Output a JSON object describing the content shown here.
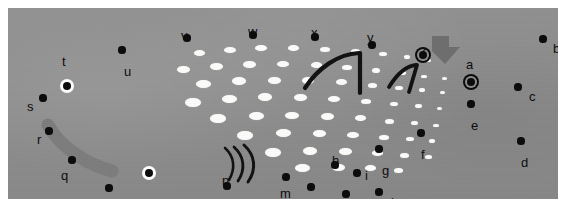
{
  "figure": {
    "kind": "annotated-grayscale-photo-panel",
    "background_color": "#8e8e8e",
    "margin_color": "#ffffff",
    "dot_color": "#fdfdfb",
    "marker_color": "#0a0a0a",
    "accent_arc_color": "#7b7b7b",
    "arrow_color": "#6e6e6e",
    "panel": {
      "x": 8,
      "y": 8,
      "width": 550,
      "height": 191
    }
  },
  "labels": [
    {
      "id": "a",
      "text": "a",
      "lx": 458,
      "ly": 50,
      "px": 463,
      "py": 74,
      "style": "ring"
    },
    {
      "id": "b",
      "text": "b",
      "lx": 545,
      "ly": 34,
      "px": 535,
      "py": 31,
      "style": "plain"
    },
    {
      "id": "c",
      "text": "c",
      "lx": 521,
      "ly": 82,
      "px": 510,
      "py": 79,
      "style": "plain"
    },
    {
      "id": "d",
      "text": "d",
      "lx": 513,
      "ly": 148,
      "px": 513,
      "py": 133,
      "style": "plain"
    },
    {
      "id": "e",
      "text": "e",
      "lx": 463,
      "ly": 111,
      "px": 463,
      "py": 96,
      "style": "plain"
    },
    {
      "id": "f",
      "text": "f",
      "lx": 413,
      "ly": 140,
      "px": 413,
      "py": 125,
      "style": "plain"
    },
    {
      "id": "g",
      "text": "g",
      "lx": 374,
      "ly": 156,
      "px": 371,
      "py": 141,
      "style": "plain"
    },
    {
      "id": "h",
      "text": "h",
      "lx": 324,
      "ly": 146,
      "px": 327,
      "py": 157,
      "style": "plain"
    },
    {
      "id": "i",
      "text": "i",
      "lx": 357,
      "ly": 161,
      "px": 349,
      "py": 165,
      "style": "plain"
    },
    {
      "id": "j",
      "text": "j",
      "lx": 383,
      "ly": 188,
      "px": 371,
      "py": 184,
      "style": "plain"
    },
    {
      "id": "k",
      "text": "k",
      "lx": 331,
      "ly": 196,
      "px": 338,
      "py": 186,
      "style": "plain"
    },
    {
      "id": "l",
      "text": "l",
      "lx": 296,
      "ly": 190,
      "px": 303,
      "py": 179,
      "style": "plain"
    },
    {
      "id": "m",
      "text": "m",
      "lx": 272,
      "ly": 179,
      "px": 278,
      "py": 169,
      "style": "plain"
    },
    {
      "id": "n",
      "text": "n",
      "lx": 214,
      "ly": 166,
      "px": 219,
      "py": 178,
      "style": "plain"
    },
    {
      "id": "o",
      "text": "o",
      "lx": 133,
      "ly": 198,
      "px": 141,
      "py": 165,
      "style": "halo"
    },
    {
      "id": "p",
      "text": "p",
      "lx": 93,
      "ly": 190,
      "px": 101,
      "py": 180,
      "style": "plain"
    },
    {
      "id": "q",
      "text": "q",
      "lx": 53,
      "ly": 161,
      "px": 64,
      "py": 152,
      "style": "plain"
    },
    {
      "id": "r",
      "text": "r",
      "lx": 29,
      "ly": 125,
      "px": 41,
      "py": 123,
      "style": "plain"
    },
    {
      "id": "s",
      "text": "s",
      "lx": 19,
      "ly": 92,
      "px": 35,
      "py": 90,
      "style": "plain"
    },
    {
      "id": "t",
      "text": "t",
      "lx": 54,
      "ly": 47,
      "px": 59,
      "py": 78,
      "style": "halo"
    },
    {
      "id": "u",
      "text": "u",
      "lx": 116,
      "ly": 57,
      "px": 114,
      "py": 42,
      "style": "plain"
    },
    {
      "id": "v",
      "text": "v",
      "lx": 173,
      "ly": 21,
      "px": 179,
      "py": 30,
      "style": "plain"
    },
    {
      "id": "w",
      "text": "w",
      "lx": 240,
      "ly": 17,
      "px": 245,
      "py": 27,
      "style": "plain"
    },
    {
      "id": "x",
      "text": "x",
      "lx": 303,
      "ly": 18,
      "px": 307,
      "py": 29,
      "style": "plain"
    },
    {
      "id": "y",
      "text": "y",
      "lx": 359,
      "ly": 23,
      "px": 364,
      "py": 37,
      "style": "plain"
    },
    {
      "id": "z",
      "text": "z",
      "lx": 412,
      "ly": 36,
      "px": 415,
      "py": 47,
      "style": "ring"
    }
  ],
  "dots": [
    {
      "x": 191,
      "y": 45,
      "w": 11,
      "h": 6
    },
    {
      "x": 222,
      "y": 42,
      "w": 12,
      "h": 6
    },
    {
      "x": 253,
      "y": 40,
      "w": 12,
      "h": 6
    },
    {
      "x": 285,
      "y": 40,
      "w": 11,
      "h": 6
    },
    {
      "x": 317,
      "y": 41,
      "w": 10,
      "h": 5
    },
    {
      "x": 347,
      "y": 43,
      "w": 9,
      "h": 5
    },
    {
      "x": 375,
      "y": 46,
      "w": 8,
      "h": 4
    },
    {
      "x": 399,
      "y": 49,
      "w": 6,
      "h": 4
    },
    {
      "x": 420,
      "y": 52,
      "w": 5,
      "h": 3
    },
    {
      "x": 175,
      "y": 61,
      "w": 13,
      "h": 7
    },
    {
      "x": 208,
      "y": 58,
      "w": 13,
      "h": 7
    },
    {
      "x": 241,
      "y": 56,
      "w": 13,
      "h": 7
    },
    {
      "x": 275,
      "y": 56,
      "w": 12,
      "h": 6
    },
    {
      "x": 308,
      "y": 57,
      "w": 11,
      "h": 6
    },
    {
      "x": 339,
      "y": 59,
      "w": 10,
      "h": 5
    },
    {
      "x": 368,
      "y": 62,
      "w": 8,
      "h": 5
    },
    {
      "x": 394,
      "y": 65,
      "w": 7,
      "h": 4
    },
    {
      "x": 416,
      "y": 68,
      "w": 6,
      "h": 3
    },
    {
      "x": 436,
      "y": 70,
      "w": 5,
      "h": 3
    },
    {
      "x": 195,
      "y": 76,
      "w": 15,
      "h": 8
    },
    {
      "x": 231,
      "y": 73,
      "w": 14,
      "h": 8
    },
    {
      "x": 266,
      "y": 72,
      "w": 13,
      "h": 7
    },
    {
      "x": 300,
      "y": 72,
      "w": 12,
      "h": 7
    },
    {
      "x": 333,
      "y": 74,
      "w": 11,
      "h": 6
    },
    {
      "x": 364,
      "y": 77,
      "w": 9,
      "h": 5
    },
    {
      "x": 391,
      "y": 80,
      "w": 8,
      "h": 4
    },
    {
      "x": 414,
      "y": 82,
      "w": 6,
      "h": 4
    },
    {
      "x": 434,
      "y": 84,
      "w": 5,
      "h": 3
    },
    {
      "x": 185,
      "y": 94,
      "w": 16,
      "h": 9
    },
    {
      "x": 221,
      "y": 91,
      "w": 15,
      "h": 8
    },
    {
      "x": 257,
      "y": 89,
      "w": 14,
      "h": 8
    },
    {
      "x": 292,
      "y": 89,
      "w": 13,
      "h": 7
    },
    {
      "x": 326,
      "y": 91,
      "w": 12,
      "h": 6
    },
    {
      "x": 358,
      "y": 93,
      "w": 10,
      "h": 5
    },
    {
      "x": 386,
      "y": 96,
      "w": 8,
      "h": 4
    },
    {
      "x": 410,
      "y": 98,
      "w": 7,
      "h": 4
    },
    {
      "x": 431,
      "y": 100,
      "w": 5,
      "h": 3
    },
    {
      "x": 210,
      "y": 110,
      "w": 16,
      "h": 9
    },
    {
      "x": 248,
      "y": 108,
      "w": 15,
      "h": 8
    },
    {
      "x": 284,
      "y": 107,
      "w": 14,
      "h": 7
    },
    {
      "x": 319,
      "y": 108,
      "w": 13,
      "h": 7
    },
    {
      "x": 352,
      "y": 110,
      "w": 11,
      "h": 6
    },
    {
      "x": 381,
      "y": 113,
      "w": 9,
      "h": 5
    },
    {
      "x": 406,
      "y": 115,
      "w": 7,
      "h": 4
    },
    {
      "x": 428,
      "y": 117,
      "w": 6,
      "h": 3
    },
    {
      "x": 237,
      "y": 127,
      "w": 16,
      "h": 9
    },
    {
      "x": 275,
      "y": 125,
      "w": 15,
      "h": 8
    },
    {
      "x": 311,
      "y": 125,
      "w": 13,
      "h": 7
    },
    {
      "x": 345,
      "y": 127,
      "w": 12,
      "h": 6
    },
    {
      "x": 376,
      "y": 129,
      "w": 10,
      "h": 5
    },
    {
      "x": 402,
      "y": 131,
      "w": 8,
      "h": 4
    },
    {
      "x": 424,
      "y": 133,
      "w": 6,
      "h": 4
    },
    {
      "x": 265,
      "y": 144,
      "w": 16,
      "h": 9
    },
    {
      "x": 302,
      "y": 143,
      "w": 14,
      "h": 8
    },
    {
      "x": 337,
      "y": 143,
      "w": 13,
      "h": 7
    },
    {
      "x": 369,
      "y": 145,
      "w": 11,
      "h": 6
    },
    {
      "x": 396,
      "y": 147,
      "w": 9,
      "h": 5
    },
    {
      "x": 420,
      "y": 149,
      "w": 7,
      "h": 4
    },
    {
      "x": 294,
      "y": 160,
      "w": 15,
      "h": 8
    },
    {
      "x": 330,
      "y": 159,
      "w": 13,
      "h": 7
    },
    {
      "x": 362,
      "y": 160,
      "w": 11,
      "h": 6
    },
    {
      "x": 390,
      "y": 162,
      "w": 9,
      "h": 5
    }
  ],
  "marks": {
    "wave_arcs": {
      "name": "wave-symbol",
      "count": 3,
      "cx": 228,
      "cy": 160
    },
    "hook_left": {
      "name": "hook-line-near-y"
    },
    "hook_right": {
      "name": "hook-line-near-z"
    },
    "banana_arc": {
      "name": "curved-gray-arc"
    },
    "pointer_arrow": {
      "name": "pointer-arrow-to-a"
    }
  }
}
